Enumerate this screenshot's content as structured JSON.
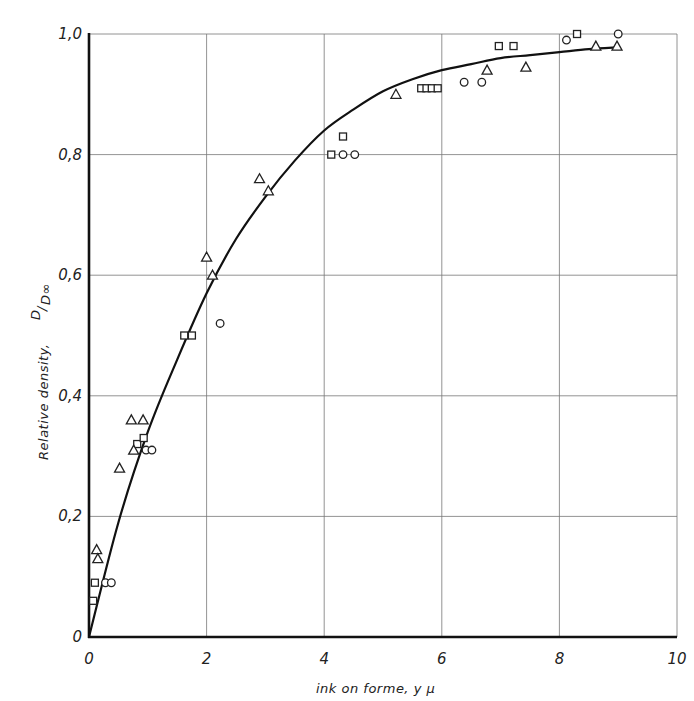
{
  "chart_data": {
    "type": "scatter",
    "title": "",
    "xlabel": "ink on forme, y μ",
    "ylabel": "Relative density,",
    "ylabel_fraction": {
      "numerator": "D",
      "denominator": "D∞"
    },
    "xlim": [
      0,
      10
    ],
    "ylim": [
      0,
      1.0
    ],
    "grid": true,
    "legend": null,
    "x_ticks": [
      0,
      2,
      4,
      6,
      8,
      10
    ],
    "x_tick_labels": [
      "0",
      "2",
      "4",
      "6",
      "8",
      "10"
    ],
    "y_ticks": [
      0,
      0.2,
      0.4,
      0.6,
      0.8,
      1.0
    ],
    "y_tick_labels": [
      "0",
      "0,2",
      "0,4",
      "0,6",
      "0,8",
      "1,0"
    ],
    "series": [
      {
        "name": "squares",
        "marker": "square",
        "points": [
          [
            0.07,
            0.06
          ],
          [
            0.1,
            0.09
          ],
          [
            0.82,
            0.32
          ],
          [
            0.93,
            0.33
          ],
          [
            1.62,
            0.5
          ],
          [
            1.75,
            0.5
          ],
          [
            4.12,
            0.8
          ],
          [
            4.32,
            0.83
          ],
          [
            5.65,
            0.91
          ],
          [
            5.74,
            0.91
          ],
          [
            5.83,
            0.91
          ],
          [
            5.93,
            0.91
          ],
          [
            6.97,
            0.98
          ],
          [
            7.22,
            0.98
          ],
          [
            8.3,
            1.0
          ]
        ]
      },
      {
        "name": "circles",
        "marker": "circle",
        "points": [
          [
            0.28,
            0.09
          ],
          [
            0.38,
            0.09
          ],
          [
            0.97,
            0.31
          ],
          [
            1.07,
            0.31
          ],
          [
            2.23,
            0.52
          ],
          [
            4.32,
            0.8
          ],
          [
            4.52,
            0.8
          ],
          [
            6.38,
            0.92
          ],
          [
            6.68,
            0.92
          ],
          [
            8.12,
            0.99
          ],
          [
            9.0,
            1.0
          ]
        ]
      },
      {
        "name": "triangles",
        "marker": "triangle",
        "points": [
          [
            0.13,
            0.145
          ],
          [
            0.15,
            0.13
          ],
          [
            0.52,
            0.28
          ],
          [
            0.72,
            0.36
          ],
          [
            0.76,
            0.31
          ],
          [
            0.92,
            0.36
          ],
          [
            2.0,
            0.63
          ],
          [
            2.1,
            0.6
          ],
          [
            2.9,
            0.76
          ],
          [
            3.05,
            0.74
          ],
          [
            5.22,
            0.9
          ],
          [
            6.77,
            0.94
          ],
          [
            7.43,
            0.945
          ],
          [
            8.62,
            0.98
          ],
          [
            8.98,
            0.98
          ]
        ]
      },
      {
        "name": "fitted curve",
        "type": "line",
        "points": [
          [
            0,
            0
          ],
          [
            0.5,
            0.19
          ],
          [
            1.0,
            0.34
          ],
          [
            1.5,
            0.46
          ],
          [
            2.0,
            0.57
          ],
          [
            2.5,
            0.66
          ],
          [
            3.0,
            0.73
          ],
          [
            3.5,
            0.79
          ],
          [
            4.0,
            0.84
          ],
          [
            4.5,
            0.875
          ],
          [
            5.0,
            0.905
          ],
          [
            5.5,
            0.925
          ],
          [
            6.0,
            0.94
          ],
          [
            6.5,
            0.95
          ],
          [
            7.0,
            0.96
          ],
          [
            7.5,
            0.965
          ],
          [
            8.0,
            0.97
          ],
          [
            8.5,
            0.975
          ],
          [
            9.0,
            0.978
          ]
        ]
      }
    ]
  },
  "layout": {
    "plot_left": 89,
    "plot_right": 677,
    "plot_top": 34,
    "plot_bottom": 637
  }
}
